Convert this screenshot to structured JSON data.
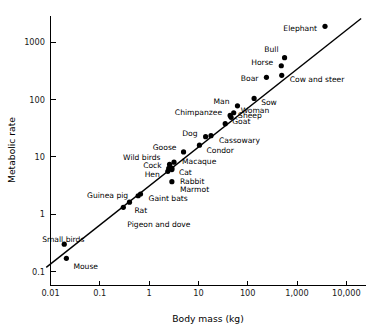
{
  "chart_data": {
    "type": "scatter",
    "title": "",
    "xlabel": "Body mass (kg)",
    "ylabel": "Metabolic rate",
    "xscale": "log",
    "yscale": "log",
    "xlim": [
      0.008,
      20000
    ],
    "ylim": [
      0.09,
      2600
    ],
    "grid": false,
    "legend": "none",
    "xticks": [
      {
        "value": 0.01,
        "label": "0.01"
      },
      {
        "value": 0.1,
        "label": "0.1"
      },
      {
        "value": 1,
        "label": "1"
      },
      {
        "value": 10,
        "label": "10"
      },
      {
        "value": 100,
        "label": "100"
      },
      {
        "value": 1000,
        "label": "1,000"
      },
      {
        "value": 10000,
        "label": "10,000"
      }
    ],
    "yticks": [
      {
        "value": 0.1,
        "label": "0.1"
      },
      {
        "value": 1,
        "label": "1"
      },
      {
        "value": 10,
        "label": "10"
      },
      {
        "value": 100,
        "label": "100"
      },
      {
        "value": 1000,
        "label": "1000"
      }
    ],
    "fit_line": {
      "description": "allometric scaling line (Kleiber's law, slope ~0.75)",
      "x": [
        0.0082,
        20000
      ],
      "y": [
        0.118,
        2600
      ]
    },
    "points": [
      {
        "label": "Mouse",
        "x": 0.021,
        "y": 0.17,
        "anchor": "start",
        "dx": 7,
        "dy": 8
      },
      {
        "label": "Small birds",
        "x": 0.019,
        "y": 0.3,
        "anchor": "middle",
        "dx": -1,
        "dy": -5
      },
      {
        "label": "Rat",
        "x": 0.4,
        "y": 1.62,
        "anchor": "start",
        "dx": 5,
        "dy": 8
      },
      {
        "label": "Pigeon and dove",
        "x": 0.3,
        "y": 1.32,
        "anchor": "start",
        "dx": 4,
        "dy": 17
      },
      {
        "label": "Guinea pig",
        "x": 0.6,
        "y": 2.1,
        "anchor": "end",
        "dx": -10,
        "dy": 0
      },
      {
        "label": "Gaint bats",
        "x": 0.67,
        "y": 2.25,
        "anchor": "start",
        "dx": 8,
        "dy": 4
      },
      {
        "label": "Hen",
        "x": 2.4,
        "y": 5.6,
        "anchor": "end",
        "dx": -8,
        "dy": 3
      },
      {
        "label": "Cock",
        "x": 2.5,
        "y": 6.3,
        "anchor": "end",
        "dx": -7,
        "dy": -3
      },
      {
        "label": "Cat",
        "x": 2.9,
        "y": 6.4,
        "anchor": "start",
        "dx": 7,
        "dy": 4
      },
      {
        "label": "Wild birds",
        "x": 2.6,
        "y": 7.4,
        "anchor": "end",
        "dx": -9,
        "dy": -7
      },
      {
        "label": "Macaque",
        "x": 3.2,
        "y": 8.1,
        "anchor": "start",
        "dx": 8,
        "dy": -1
      },
      {
        "label": "Rabbit",
        "x": 2.9,
        "y": 6.0,
        "anchor": "start",
        "dx": 8,
        "dy": 12
      },
      {
        "label": "Marmot",
        "x": 2.9,
        "y": 3.7,
        "anchor": "start",
        "dx": 8,
        "dy": 8
      },
      {
        "label": "Goose",
        "x": 5.0,
        "y": 12.2,
        "anchor": "end",
        "dx": -7,
        "dy": -5
      },
      {
        "label": "Condor",
        "x": 10.5,
        "y": 16.0,
        "anchor": "start",
        "dx": 7,
        "dy": 5
      },
      {
        "label": "Dog",
        "x": 14.0,
        "y": 22.5,
        "anchor": "end",
        "dx": -8,
        "dy": -3
      },
      {
        "label": "Cassowary",
        "x": 18.0,
        "y": 23.5,
        "anchor": "start",
        "dx": 8,
        "dy": 5
      },
      {
        "label": "Goat",
        "x": 35.0,
        "y": 38.0,
        "anchor": "start",
        "dx": 7,
        "dy": -2
      },
      {
        "label": "Sheep",
        "x": 46.0,
        "y": 49.0,
        "anchor": "start",
        "dx": 7,
        "dy": -2
      },
      {
        "label": "Chimpanzee",
        "x": 44.0,
        "y": 53.0,
        "anchor": "end",
        "dx": -8,
        "dy": -3
      },
      {
        "label": "Woman",
        "x": 52.0,
        "y": 59.0,
        "anchor": "start",
        "dx": 7,
        "dy": -2
      },
      {
        "label": "Man",
        "x": 62.0,
        "y": 78.0,
        "anchor": "end",
        "dx": -8,
        "dy": -4
      },
      {
        "label": "Sow",
        "x": 135.0,
        "y": 105.0,
        "anchor": "start",
        "dx": 7,
        "dy": 4
      },
      {
        "label": "Boar",
        "x": 240.0,
        "y": 245.0,
        "anchor": "end",
        "dx": -8,
        "dy": 1
      },
      {
        "label": "Horse",
        "x": 480.0,
        "y": 390.0,
        "anchor": "end",
        "dx": -8,
        "dy": -3
      },
      {
        "label": "Bull",
        "x": 560.0,
        "y": 540.0,
        "anchor": "end",
        "dx": -6,
        "dy": -8
      },
      {
        "label": "Cow and steer",
        "x": 490.0,
        "y": 265.0,
        "anchor": "start",
        "dx": 8,
        "dy": 4
      },
      {
        "label": "Elephant",
        "x": 3700.0,
        "y": 1900.0,
        "anchor": "end",
        "dx": -8,
        "dy": 2
      }
    ]
  },
  "colors": {
    "axis": "#000000",
    "point": "#000000",
    "line": "#000000",
    "tick_text": "#1a1a1a",
    "background": "#ffffff"
  }
}
